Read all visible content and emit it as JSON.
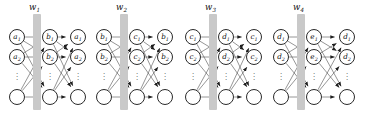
{
  "figure": {
    "type": "diagram",
    "width": 369,
    "height": 123,
    "background": "#ffffff",
    "node_stroke": "#2a2a2a",
    "edge_color": "#555555",
    "weight_bar_color": "#c9c9c9",
    "vertical_ellipsis": "⋮"
  },
  "blocks": [
    {
      "id": "block-1",
      "weight_label": "w",
      "weight_sub": "1",
      "bar_x": 33,
      "bar_y": 14,
      "bar_w": 8,
      "bar_h": 96,
      "label_x": 29,
      "label_y": 3,
      "columns": [
        {
          "id": "col-input-1",
          "cx": 17,
          "nodes": [
            {
              "label": "a",
              "sub": "1"
            },
            {
              "label": "a",
              "sub": "2"
            },
            {
              "label": "",
              "sub": ""
            }
          ]
        },
        {
          "id": "col-hidden-1",
          "cx": 50,
          "nodes": [
            {
              "label": "b",
              "sub": "1"
            },
            {
              "label": "b",
              "sub": "2"
            },
            {
              "label": "",
              "sub": ""
            }
          ]
        },
        {
          "id": "col-output-1",
          "cx": 78,
          "nodes": [
            {
              "label": "a",
              "sub": "1"
            },
            {
              "label": "a",
              "sub": "2"
            },
            {
              "label": "",
              "sub": ""
            }
          ]
        }
      ]
    },
    {
      "id": "block-2",
      "weight_label": "w",
      "weight_sub": "2",
      "bar_x": 120,
      "bar_y": 14,
      "bar_w": 8,
      "bar_h": 96,
      "label_x": 116,
      "label_y": 3,
      "columns": [
        {
          "id": "col-input-2",
          "cx": 104,
          "nodes": [
            {
              "label": "b",
              "sub": "1"
            },
            {
              "label": "b",
              "sub": "2"
            },
            {
              "label": "",
              "sub": ""
            }
          ]
        },
        {
          "id": "col-hidden-2",
          "cx": 137,
          "nodes": [
            {
              "label": "c",
              "sub": "1"
            },
            {
              "label": "c",
              "sub": "2"
            },
            {
              "label": "",
              "sub": ""
            }
          ]
        },
        {
          "id": "col-output-2",
          "cx": 165,
          "nodes": [
            {
              "label": "b",
              "sub": "1"
            },
            {
              "label": "b",
              "sub": "2"
            },
            {
              "label": "",
              "sub": ""
            }
          ]
        }
      ]
    },
    {
      "id": "block-3",
      "weight_label": "w",
      "weight_sub": "3",
      "bar_x": 209,
      "bar_y": 14,
      "bar_w": 8,
      "bar_h": 96,
      "label_x": 205,
      "label_y": 3,
      "columns": [
        {
          "id": "col-input-3",
          "cx": 193,
          "nodes": [
            {
              "label": "c",
              "sub": "1"
            },
            {
              "label": "c",
              "sub": "2"
            },
            {
              "label": "",
              "sub": ""
            }
          ]
        },
        {
          "id": "col-hidden-3",
          "cx": 226,
          "nodes": [
            {
              "label": "d",
              "sub": "1"
            },
            {
              "label": "d",
              "sub": "2"
            },
            {
              "label": "",
              "sub": ""
            }
          ]
        },
        {
          "id": "col-output-3",
          "cx": 254,
          "nodes": [
            {
              "label": "c",
              "sub": "1"
            },
            {
              "label": "c",
              "sub": "2"
            },
            {
              "label": "",
              "sub": ""
            }
          ]
        }
      ]
    },
    {
      "id": "block-4",
      "weight_label": "w",
      "weight_sub": "4",
      "bar_x": 297,
      "bar_y": 14,
      "bar_w": 8,
      "bar_h": 96,
      "label_x": 293,
      "label_y": 3,
      "columns": [
        {
          "id": "col-input-4",
          "cx": 281,
          "nodes": [
            {
              "label": "d",
              "sub": "1"
            },
            {
              "label": "d",
              "sub": "2"
            },
            {
              "label": "",
              "sub": ""
            }
          ]
        },
        {
          "id": "col-hidden-4",
          "cx": 314,
          "nodes": [
            {
              "label": "e",
              "sub": "1"
            },
            {
              "label": "e",
              "sub": "2"
            },
            {
              "label": "",
              "sub": ""
            }
          ]
        },
        {
          "id": "col-output-4",
          "cx": 347,
          "nodes": [
            {
              "label": "d",
              "sub": "1"
            },
            {
              "label": "d",
              "sub": "2"
            },
            {
              "label": "",
              "sub": ""
            }
          ]
        }
      ]
    }
  ],
  "geometry": {
    "node_radius": 8.2,
    "row_y": [
      37,
      57,
      97
    ],
    "ellipsis_y": 71
  }
}
